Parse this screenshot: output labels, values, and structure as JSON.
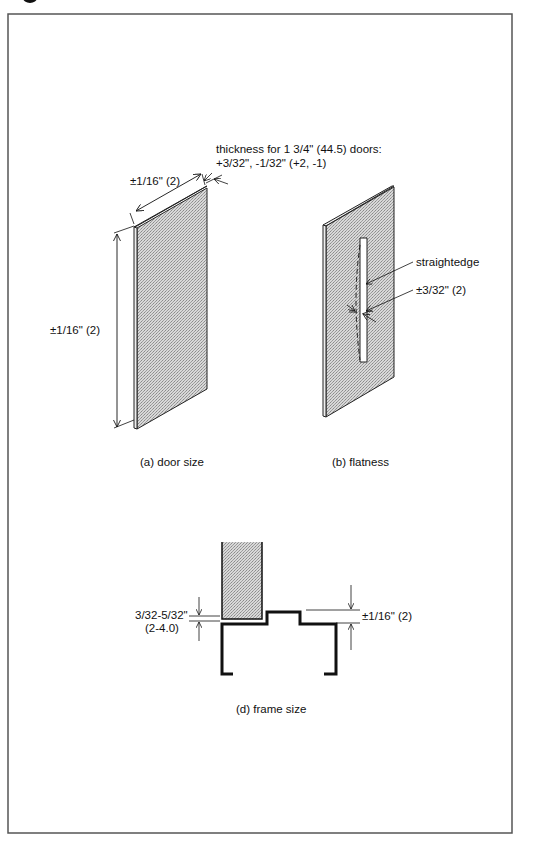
{
  "figure": {
    "frame_border_color": "#555555",
    "fill_color": "#cfcfcf",
    "line_color": "#111111"
  },
  "panel_a": {
    "caption": "(a) door size",
    "width_tolerance": "±1/16\" (2)",
    "height_tolerance": "±1/16\" (2)",
    "thickness_line1": "thickness for 1 3/4\" (44.5) doors:",
    "thickness_line2": "+3/32\", -1/32\" (+2, -1)"
  },
  "panel_b": {
    "caption": "(b) flatness",
    "straightedge_label": "straightedge",
    "flatness_tolerance": "±3/32\" (2)"
  },
  "panel_d": {
    "caption": "(d) frame size",
    "clearance_line1": "3/32-5/32\"",
    "clearance_line2": "(2-4.0)",
    "frame_tolerance": "±1/16\" (2)"
  }
}
